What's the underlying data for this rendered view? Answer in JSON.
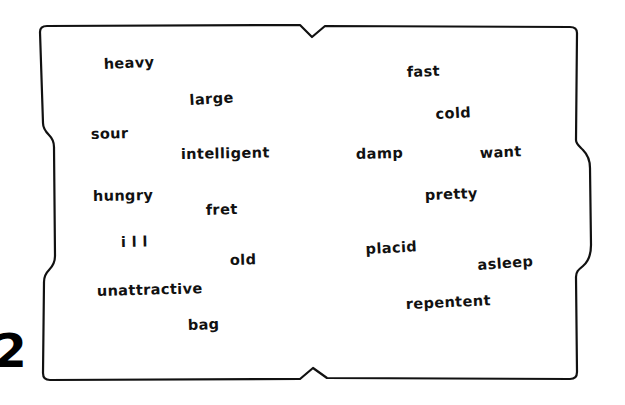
{
  "worksheet": {
    "exercise_number": "2",
    "box": {
      "stroke_color": "#111111",
      "fill_color": "#ffffff",
      "style": "hand-drawn-wavy-rectangle"
    },
    "words": [
      {
        "text": "heavy",
        "x": 104,
        "y": 70,
        "rotate": -2.5
      },
      {
        "text": "large",
        "x": 190,
        "y": 106,
        "rotate": -3.5
      },
      {
        "text": "sour",
        "x": 91,
        "y": 140,
        "rotate": -1.5
      },
      {
        "text": "intelligent",
        "x": 181,
        "y": 160,
        "rotate": -1.0
      },
      {
        "text": "hungry",
        "x": 93,
        "y": 202,
        "rotate": -1.0
      },
      {
        "text": "fret",
        "x": 206,
        "y": 216,
        "rotate": -2.0
      },
      {
        "text": "i l l",
        "x": 121,
        "y": 248,
        "rotate": -1.0
      },
      {
        "text": "old",
        "x": 230,
        "y": 266,
        "rotate": -1.5
      },
      {
        "text": "unattractive",
        "x": 97,
        "y": 297,
        "rotate": -1.5
      },
      {
        "text": "bag",
        "x": 188,
        "y": 331,
        "rotate": -2.0
      },
      {
        "text": "fast",
        "x": 407,
        "y": 78,
        "rotate": -2.0
      },
      {
        "text": "cold",
        "x": 436,
        "y": 120,
        "rotate": -3.0
      },
      {
        "text": "damp",
        "x": 356,
        "y": 160,
        "rotate": -1.5
      },
      {
        "text": "want",
        "x": 480,
        "y": 159,
        "rotate": -2.5
      },
      {
        "text": "pretty",
        "x": 425,
        "y": 201,
        "rotate": -2.0
      },
      {
        "text": "placid",
        "x": 366,
        "y": 255,
        "rotate": -3.0
      },
      {
        "text": "asleep",
        "x": 478,
        "y": 271,
        "rotate": -4.0
      },
      {
        "text": "repentent",
        "x": 406,
        "y": 310,
        "rotate": -2.5
      }
    ]
  }
}
